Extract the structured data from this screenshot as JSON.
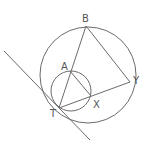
{
  "diagram": {
    "title": "",
    "points": {
      "B": {
        "label": "B",
        "x": 86,
        "y": 26,
        "lx": 82,
        "ly": 22
      },
      "A": {
        "label": "A",
        "x": 70,
        "y": 71,
        "lx": 61,
        "ly": 70
      },
      "T": {
        "label": "T",
        "x": 59,
        "y": 108,
        "lx": 50,
        "ly": 117
      },
      "X": {
        "label": "X",
        "x": 91,
        "y": 96,
        "lx": 93,
        "ly": 108
      },
      "Y": {
        "label": "Y",
        "x": 130,
        "y": 82,
        "lx": 133,
        "ly": 84
      }
    },
    "circles": [
      {
        "name": "large-circle",
        "cx": 88,
        "cy": 75,
        "r": 48
      },
      {
        "name": "small-circle",
        "cx": 71,
        "cy": 91,
        "r": 20
      }
    ],
    "segments": [
      {
        "name": "segment-TB",
        "from": "T",
        "to": "B"
      },
      {
        "name": "segment-BY",
        "from": "B",
        "to": "Y"
      },
      {
        "name": "segment-TY",
        "from": "T",
        "to": "Y"
      },
      {
        "name": "segment-AX",
        "from": "A",
        "to": "X"
      }
    ],
    "tangent_line": {
      "x1": 4,
      "y1": 51,
      "x2": 90,
      "y2": 140
    },
    "stroke_color": "#6b6b6b",
    "label_color": "#555555"
  }
}
